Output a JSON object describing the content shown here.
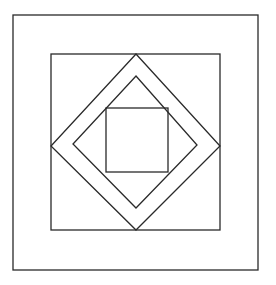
{
  "figure": {
    "stroke_color": "#2a2a2a",
    "background": "#ffffff",
    "shapes": [
      {
        "name": "outer-square",
        "type": "rect",
        "x": 13,
        "y": 15,
        "w": 245,
        "h": 255
      },
      {
        "name": "middle-square",
        "type": "rect",
        "x": 51,
        "y": 54,
        "w": 169,
        "h": 176
      },
      {
        "name": "outer-diamond",
        "type": "polygon",
        "points": "136,54 220,146 136,230 51,146"
      },
      {
        "name": "inner-diamond",
        "type": "polygon",
        "points": "136,76 197,145 136,208 73,144"
      },
      {
        "name": "inner-square",
        "type": "rect",
        "x": 106,
        "y": 108,
        "w": 62,
        "h": 64
      }
    ]
  }
}
